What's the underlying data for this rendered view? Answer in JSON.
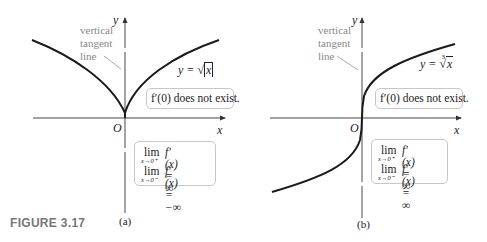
{
  "figure": {
    "label": "FIGURE 3.17"
  },
  "panels": [
    {
      "id": "a",
      "caption": "(a)",
      "axis_x": "x",
      "axis_y": "y",
      "origin": "O",
      "tangent_label": [
        "vertical",
        "tangent",
        "line"
      ],
      "function_label": "y = √|x|",
      "function_prefix": "y = ",
      "function_body": "x",
      "note": "f′(0) does not exist.",
      "limits": [
        {
          "lim": "lim",
          "sub": "x→0⁺",
          "expr": "f′(x) = ∞"
        },
        {
          "lim": "lim",
          "sub": "x→0⁻",
          "expr": "f′(x) = −∞"
        }
      ]
    },
    {
      "id": "b",
      "caption": "(b)",
      "axis_x": "x",
      "axis_y": "y",
      "origin": "O",
      "tangent_label": [
        "vertical",
        "tangent",
        "line"
      ],
      "function_label": "y = ∛x",
      "function_prefix": "y = ",
      "function_index": "3",
      "function_body": "x",
      "note": "f′(0) does not exist.",
      "limits": [
        {
          "lim": "lim",
          "sub": "x→0⁺",
          "expr": "f′(x) = ∞"
        },
        {
          "lim": "lim",
          "sub": "x→0⁻",
          "expr": "f′(x) = ∞"
        }
      ]
    }
  ],
  "colors": {
    "curve": "#1a1a1a",
    "axis": "#333333",
    "box_border": "#c8c8c8",
    "label_gray": "#888888",
    "figure_label": "#777777"
  }
}
